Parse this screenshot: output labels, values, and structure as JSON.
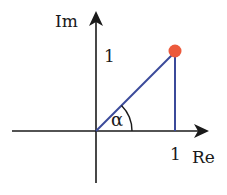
{
  "diagram": {
    "type": "complex-plane",
    "axes": {
      "x_label": "Re",
      "y_label": "Im",
      "x_tick_label": "1",
      "y_tick_label": "1"
    },
    "angle_label": "α",
    "point": {
      "re": 1,
      "im": 1,
      "color": "#ec5a3c"
    },
    "colors": {
      "axis": "#1a1a1a",
      "vector": "#3b4a9a",
      "point": "#ec5a3c"
    }
  }
}
